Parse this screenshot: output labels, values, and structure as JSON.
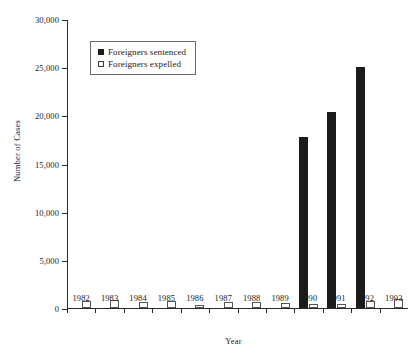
{
  "chart_data": {
    "type": "bar",
    "title": "",
    "xlabel": "Year",
    "ylabel": "Number of Cases",
    "categories": [
      "1982",
      "1983",
      "1984",
      "1985",
      "1986",
      "1987",
      "1988",
      "1989",
      "1990",
      "1991",
      "1992",
      "1993"
    ],
    "series": [
      {
        "name": "Foreigners sentenced",
        "color": "#1b1b1b",
        "style": "filled",
        "values": [
          0,
          0,
          0,
          0,
          0,
          0,
          0,
          0,
          17800,
          20300,
          25000,
          0
        ]
      },
      {
        "name": "Foreigners expelled",
        "color": "#ffffff",
        "style": "hollow",
        "values": [
          700,
          800,
          650,
          700,
          300,
          600,
          600,
          550,
          450,
          400,
          700,
          950
        ]
      }
    ],
    "ylim": [
      0,
      30000
    ],
    "yticks": [
      0,
      5000,
      10000,
      15000,
      20000,
      25000,
      30000
    ],
    "ytick_labels": [
      "0",
      "5,000",
      "10,000",
      "15,000",
      "20,000",
      "25,000",
      "30,000"
    ],
    "grid": false,
    "legend_position": "top-left-inside"
  },
  "legend": {
    "items": [
      {
        "label": "Foreigners sentenced",
        "marker": "filled-square-icon"
      },
      {
        "label": "Foreigners expelled",
        "marker": "hollow-square-icon"
      }
    ]
  },
  "axes": {
    "y_title": "Number of Cases",
    "x_title": "Year"
  }
}
